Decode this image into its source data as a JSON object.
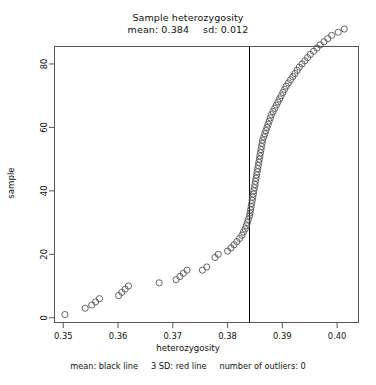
{
  "title": {
    "line1": "Sample heterozygosity",
    "line2_mean": "mean: 0.384",
    "line2_sd": "sd: 0.012"
  },
  "caption": {
    "mean_legend": "mean: black line",
    "sd_legend": "3 SD: red line",
    "outliers": "number of outliers: 0"
  },
  "axes": {
    "xlabel": "heterozygosity",
    "ylabel": "sample",
    "xticks": [
      "0.35",
      "0.36",
      "0.37",
      "0.38",
      "0.39",
      "0.40"
    ],
    "yticks": [
      "0",
      "20",
      "40",
      "60",
      "80"
    ]
  },
  "colors": {
    "point_stroke": "#555555",
    "panel_border": "#555555",
    "mean_line": "#000000",
    "background": "#ffffff",
    "text": "#111111"
  },
  "chart_data": {
    "type": "scatter",
    "title": "Sample heterozygosity",
    "subtitle": "mean: 0.384   sd: 0.012",
    "xlabel": "heterozygosity",
    "ylabel": "sample",
    "xlim": [
      0.3484,
      0.4039
    ],
    "ylim": [
      -1.5,
      85.5
    ],
    "grid": false,
    "legend": "none",
    "marker": "open-circle",
    "marker_size": 3.1,
    "annotations": [
      {
        "type": "vline",
        "value": 0.384,
        "color": "#000000",
        "label": "mean"
      }
    ],
    "mean": 0.384,
    "sd": 0.012,
    "n_outliers": 0,
    "x": [
      0.3503,
      0.354,
      0.3552,
      0.3559,
      0.3566,
      0.3601,
      0.3607,
      0.3613,
      0.3619,
      0.3675,
      0.3706,
      0.3713,
      0.3719,
      0.3726,
      0.3754,
      0.3762,
      0.3777,
      0.3783,
      0.38,
      0.3806,
      0.3812,
      0.3817,
      0.3822,
      0.3826,
      0.3829,
      0.3832,
      0.3834,
      0.3836,
      0.3838,
      0.384,
      0.3841,
      0.3842,
      0.3843,
      0.3844,
      0.3845,
      0.3846,
      0.3847,
      0.3848,
      0.3849,
      0.385,
      0.3851,
      0.3852,
      0.3853,
      0.3854,
      0.3855,
      0.3856,
      0.3857,
      0.3858,
      0.3859,
      0.386,
      0.3861,
      0.3862,
      0.3863,
      0.3864,
      0.3866,
      0.3868,
      0.387,
      0.3872,
      0.3874,
      0.3876,
      0.3878,
      0.388,
      0.3883,
      0.3886,
      0.3889,
      0.3892,
      0.3895,
      0.3898,
      0.3901,
      0.3904,
      0.3907,
      0.3911,
      0.3915,
      0.3919,
      0.3923,
      0.3927,
      0.3931,
      0.3936,
      0.3941,
      0.3946,
      0.3951,
      0.3957,
      0.3963,
      0.3969,
      0.3976,
      0.3983,
      0.399,
      0.4002,
      0.4013
    ],
    "y": [
      1,
      3,
      4,
      5,
      6,
      7,
      8,
      9,
      10,
      11,
      12,
      13,
      14,
      15,
      15,
      16,
      19,
      20,
      21,
      22,
      23,
      24,
      25,
      26,
      27,
      28,
      29,
      30,
      31,
      32,
      33,
      34,
      35,
      36,
      37,
      38,
      39,
      40,
      41,
      42,
      43,
      44,
      45,
      46,
      47,
      48,
      49,
      50,
      51,
      52,
      53,
      54,
      55,
      56,
      57,
      58,
      59,
      60,
      61,
      62,
      63,
      64,
      65,
      66,
      67,
      68,
      69,
      70,
      71,
      72,
      73,
      74,
      75,
      76,
      77,
      78,
      79,
      80,
      81,
      82,
      83,
      84,
      85,
      86,
      87,
      88,
      89,
      90,
      91
    ]
  }
}
